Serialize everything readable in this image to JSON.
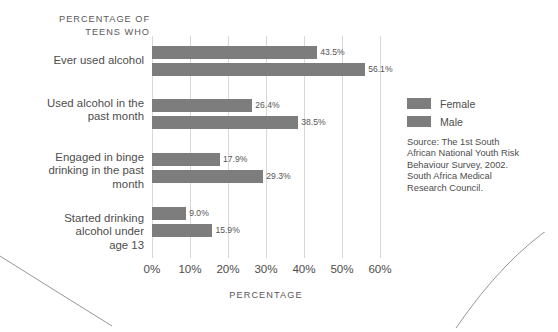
{
  "chart_data": {
    "type": "bar",
    "orientation": "horizontal",
    "title": "PERCENTAGE OF\nTEENS WHO",
    "xlabel": "PERCENTAGE",
    "ylabel": "",
    "xlim": [
      0,
      60
    ],
    "xticks": [
      "0%",
      "10%",
      "20%",
      "30%",
      "40%",
      "50%",
      "60%"
    ],
    "xtick_values": [
      0,
      10,
      20,
      30,
      40,
      50,
      60
    ],
    "grid": "vertical",
    "legend_position": "right",
    "categories": [
      "Ever used alcohol",
      "Used alcohol in the\npast month",
      "Engaged in binge\ndrinking in the past\nmonth",
      "Started drinking\nalcohol under\nage 13"
    ],
    "series": [
      {
        "name": "Female",
        "color": "#7d7d7d",
        "values": [
          43.5,
          26.4,
          17.9,
          9.0
        ],
        "labels": [
          "43.5%",
          "26.4%",
          "17.9%",
          "9.0%"
        ]
      },
      {
        "name": "Male",
        "color": "#7d7d7d",
        "values": [
          56.1,
          38.5,
          29.3,
          15.9
        ],
        "labels": [
          "56.1%",
          "38.5%",
          "29.3%",
          "15.9%"
        ]
      }
    ],
    "source": "Source: The 1st South\nAfrican National Youth Risk\nBehaviour Survey, 2002.\nSouth Africa Medical\nResearch Council."
  },
  "legend": {
    "items": [
      {
        "label": "Female"
      },
      {
        "label": "Male"
      }
    ]
  }
}
